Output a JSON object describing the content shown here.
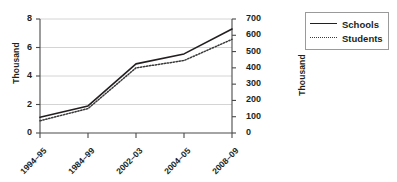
{
  "chart_data": {
    "type": "line",
    "title": "",
    "xlabel": "",
    "categories": [
      "1994–95",
      "1984–99",
      "2002–03",
      "2004–05",
      "2008–09"
    ],
    "grid": true,
    "legend_position": "right",
    "axes": {
      "left": {
        "label": "Thousand",
        "ticks": [
          "0",
          "2",
          "4",
          "6",
          "8"
        ],
        "tick_values": [
          0,
          2,
          4,
          6,
          8
        ],
        "ylim": [
          0,
          8
        ],
        "series": "Schools"
      },
      "right": {
        "label": "Thousand",
        "ticks": [
          "0",
          "100",
          "200",
          "300",
          "400",
          "500",
          "600",
          "700"
        ],
        "tick_values": [
          0,
          100,
          200,
          300,
          400,
          500,
          600,
          700
        ],
        "ylim": [
          0,
          700
        ],
        "series": "Students"
      }
    },
    "series": [
      {
        "name": "Schools",
        "axis": "left",
        "style": "solid",
        "color": "#231f20",
        "values": [
          1.1,
          1.9,
          4.85,
          5.55,
          7.3
        ]
      },
      {
        "name": "Students",
        "axis": "right",
        "style": "dotted",
        "color": "#3a3a3a",
        "values": [
          75,
          150,
          400,
          445,
          575
        ]
      }
    ]
  },
  "legend": {
    "items": [
      {
        "label": "Schools",
        "style": "solid"
      },
      {
        "label": "Students",
        "style": "dotted"
      }
    ]
  }
}
